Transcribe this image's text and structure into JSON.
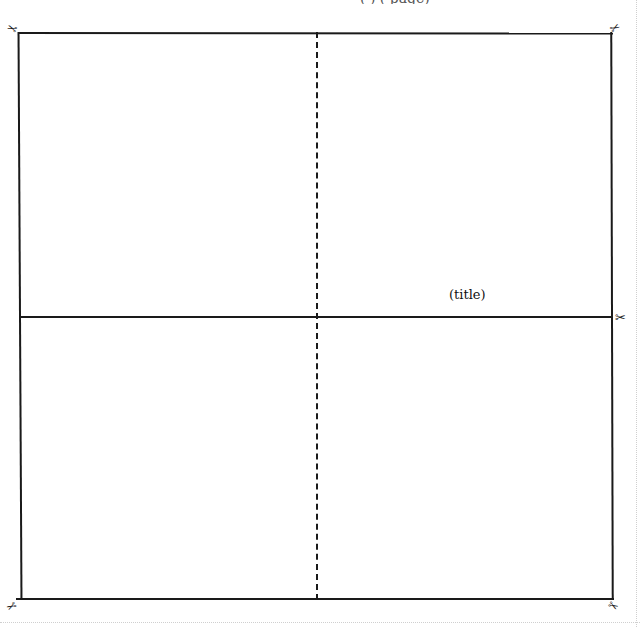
{
  "header": {
    "clipped_text": "( ) (  page)"
  },
  "template": {
    "title_label": "(title)",
    "fold_lines": {
      "horizontal": "solid",
      "vertical": "dashed"
    }
  },
  "icons": {
    "scissors_glyph": "✂"
  },
  "colors": {
    "line": "#1a1a1a",
    "perforation": "#cfcfcf",
    "background": "#ffffff"
  }
}
